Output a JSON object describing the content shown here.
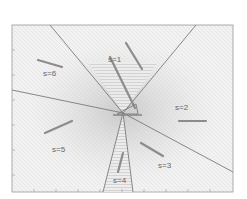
{
  "diagram": {
    "frame": {
      "x": 12,
      "y": 25,
      "w": 221,
      "h": 167
    },
    "center": {
      "x": 123,
      "y": 113
    },
    "colors": {
      "line": "#7a7a7a",
      "arrow": "#8c8c8c",
      "label": "#666666",
      "shade": "#cfcfcf",
      "background": "#f4f4f4"
    },
    "regions": [
      {
        "id": "s1",
        "label": "s=1",
        "lx": 108,
        "ly": 62
      },
      {
        "id": "s2",
        "label": "s=2",
        "lx": 175,
        "ly": 110
      },
      {
        "id": "s3",
        "label": "s=3",
        "lx": 158,
        "ly": 168
      },
      {
        "id": "s4",
        "label": "s=4",
        "lx": 113,
        "ly": 183
      },
      {
        "id": "s5",
        "label": "s=5",
        "lx": 52,
        "ly": 152
      },
      {
        "id": "s6",
        "label": "s=6",
        "lx": 43,
        "ly": 76
      }
    ],
    "boundaries": [
      {
        "x2": 50,
        "y2": 25
      },
      {
        "x2": 196,
        "y2": 25
      },
      {
        "x2": 12,
        "y2": 90
      },
      {
        "x2": 233,
        "y2": 172
      },
      {
        "x2": 103,
        "y2": 192
      },
      {
        "x2": 133,
        "y2": 192
      }
    ],
    "arrows": [
      {
        "region": "s1",
        "x1": 126,
        "y1": 43,
        "x2": 142,
        "y2": 69
      },
      {
        "region": "s1",
        "x1": 110,
        "y1": 57,
        "x2": 135,
        "y2": 108
      },
      {
        "region": "s2",
        "x1": 206,
        "y1": 121,
        "x2": 179,
        "y2": 121
      },
      {
        "region": "s3",
        "x1": 163,
        "y1": 156,
        "x2": 141,
        "y2": 143
      },
      {
        "region": "s4",
        "x1": 118,
        "y1": 172,
        "x2": 123,
        "y2": 153
      },
      {
        "region": "s5",
        "x1": 45,
        "y1": 133,
        "x2": 72,
        "y2": 121
      },
      {
        "region": "s6",
        "x1": 38,
        "y1": 60,
        "x2": 62,
        "y2": 67
      }
    ]
  }
}
